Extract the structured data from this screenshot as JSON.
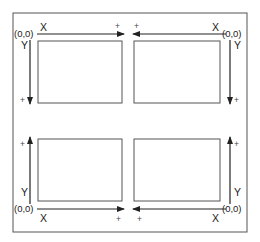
{
  "diagram": {
    "title": "",
    "colors": {
      "line": "#333333",
      "frame": "#555555",
      "background": "#ffffff"
    },
    "quadrants": [
      {
        "id": "top-left",
        "origin_label": "(0,0)",
        "x_label": "X",
        "y_label": "Y",
        "x_plus": "+",
        "y_plus": "+",
        "x_direction": "right",
        "y_direction": "down"
      },
      {
        "id": "top-right",
        "origin_label": "(0,0)",
        "x_label": "X",
        "y_label": "Y",
        "x_plus": "+",
        "y_plus": "+",
        "x_direction": "left",
        "y_direction": "down"
      },
      {
        "id": "bottom-left",
        "origin_label": "(0,0)",
        "x_label": "X",
        "y_label": "Y",
        "x_plus": "+",
        "y_plus": "+",
        "x_direction": "right",
        "y_direction": "up"
      },
      {
        "id": "bottom-right",
        "origin_label": "(0,0)",
        "x_label": "X",
        "y_label": "Y",
        "x_plus": "+",
        "y_plus": "+",
        "x_direction": "left",
        "y_direction": "up"
      }
    ]
  }
}
